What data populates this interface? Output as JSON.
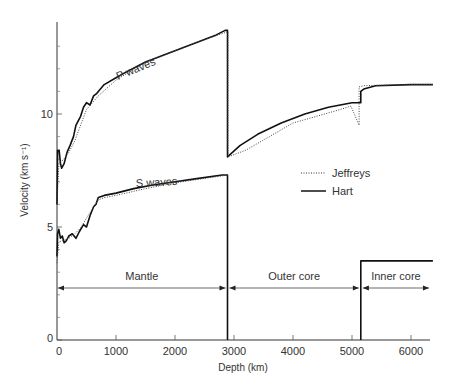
{
  "chart_data": {
    "type": "line",
    "title": "",
    "xlabel": "Depth (km)",
    "ylabel": "Velocity (km s⁻¹)",
    "xlim": [
      0,
      6371
    ],
    "ylim": [
      0,
      14
    ],
    "x_ticks": [
      0,
      1000,
      2000,
      3000,
      4000,
      5000,
      6000
    ],
    "x_tick_labels": [
      "0",
      "1000",
      "2000",
      "3000",
      "4000",
      "5000",
      "6000"
    ],
    "y_ticks_major": [
      0,
      5,
      10
    ],
    "y_tick_labels": [
      "0",
      "5",
      "10"
    ],
    "y_ticks_minor": [
      1,
      2,
      3,
      4,
      6,
      7,
      8,
      9,
      11,
      12,
      13
    ],
    "grid": false,
    "legend": {
      "position": "right-center",
      "entries": [
        {
          "name": "Jeffreys",
          "style": "dotted"
        },
        {
          "name": "Hart",
          "style": "solid"
        }
      ]
    },
    "annotations": {
      "p_label": "P waves",
      "s_label": "S waves",
      "regions": [
        {
          "label": "Mantle",
          "from": 0,
          "to": 2890
        },
        {
          "label": "Outer core",
          "from": 2890,
          "to": 5150
        },
        {
          "label": "Inner core",
          "from": 5150,
          "to": 6371
        }
      ]
    },
    "series": [
      {
        "name": "Hart P waves",
        "style": "solid",
        "x": [
          0,
          10,
          15,
          35,
          60,
          80,
          120,
          170,
          220,
          280,
          320,
          400,
          450,
          500,
          560,
          620,
          670,
          700,
          800,
          1000,
          1200,
          1500,
          1800,
          2100,
          2400,
          2700,
          2850,
          2890,
          2890,
          3100,
          3400,
          3800,
          4200,
          4600,
          5000,
          5150,
          5150,
          5200,
          5400,
          6000,
          6371
        ],
        "values": [
          6.0,
          8.4,
          8.35,
          8.4,
          7.8,
          7.6,
          7.8,
          8.3,
          8.6,
          9.0,
          9.5,
          9.9,
          10.3,
          10.5,
          10.4,
          10.8,
          10.9,
          11.0,
          11.3,
          11.6,
          11.9,
          12.3,
          12.6,
          12.9,
          13.2,
          13.5,
          13.7,
          13.7,
          8.1,
          8.6,
          9.1,
          9.6,
          10.0,
          10.3,
          10.5,
          10.5,
          11.0,
          11.1,
          11.25,
          11.3,
          11.3
        ]
      },
      {
        "name": "Jeffreys P waves",
        "style": "dotted",
        "x": [
          0,
          33,
          60,
          100,
          200,
          300,
          413,
          500,
          600,
          700,
          1000,
          1500,
          2000,
          2500,
          2898,
          2898,
          3200,
          3600,
          4000,
          4400,
          4800,
          4982,
          5121,
          5121,
          5200,
          5400,
          6000,
          6371
        ],
        "values": [
          6.0,
          7.8,
          7.9,
          7.95,
          8.3,
          8.8,
          9.6,
          10.2,
          10.5,
          10.8,
          11.5,
          12.3,
          12.8,
          13.3,
          13.64,
          8.1,
          8.4,
          9.0,
          9.6,
          9.9,
          10.2,
          10.35,
          9.5,
          11.2,
          11.25,
          11.27,
          11.3,
          11.3
        ]
      },
      {
        "name": "Hart S waves",
        "style": "solid",
        "x": [
          0,
          10,
          30,
          60,
          90,
          120,
          160,
          200,
          260,
          320,
          380,
          450,
          500,
          560,
          620,
          660,
          700,
          800,
          1000,
          1300,
          1600,
          2000,
          2400,
          2800,
          2890,
          2890
        ],
        "values": [
          3.7,
          4.7,
          4.9,
          4.5,
          4.6,
          4.3,
          4.4,
          4.6,
          4.7,
          4.5,
          4.8,
          5.1,
          5.0,
          5.5,
          5.9,
          6.0,
          6.3,
          6.4,
          6.5,
          6.7,
          6.85,
          7.0,
          7.15,
          7.3,
          7.3,
          0.0
        ]
      },
      {
        "name": "Jeffreys S waves",
        "style": "dotted",
        "x": [
          0,
          33,
          100,
          200,
          300,
          413,
          500,
          600,
          700,
          800,
          1000,
          1500,
          2000,
          2500,
          2898
        ],
        "values": [
          3.4,
          4.35,
          4.4,
          4.5,
          4.7,
          5.0,
          5.4,
          5.8,
          6.2,
          6.3,
          6.4,
          6.7,
          6.95,
          7.15,
          7.3
        ]
      },
      {
        "name": "Hart S waves inner core",
        "style": "solid",
        "x": [
          5150,
          5150,
          6371
        ],
        "values": [
          0.0,
          3.5,
          3.5
        ]
      }
    ]
  }
}
